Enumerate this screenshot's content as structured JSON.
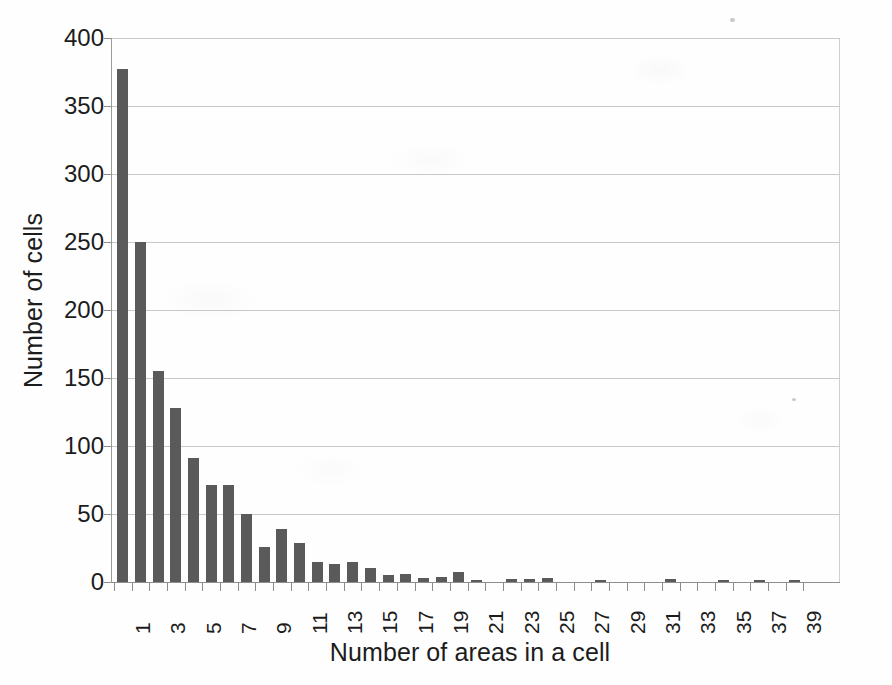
{
  "chart_data": {
    "type": "bar",
    "title": "",
    "subtitle": "",
    "xlabel": "Number of areas in a cell",
    "ylabel": "Number of cells",
    "xlim": [
      0,
      41
    ],
    "ylim": [
      0,
      400
    ],
    "ytick_values": [
      0,
      50,
      100,
      150,
      200,
      250,
      300,
      350,
      400
    ],
    "ytick_labels": [
      "0",
      "50",
      "100",
      "150",
      "200",
      "250",
      "300",
      "350",
      "400"
    ],
    "xtick_values": [
      1,
      3,
      5,
      7,
      9,
      11,
      13,
      15,
      17,
      19,
      21,
      23,
      25,
      27,
      29,
      31,
      33,
      35,
      37,
      39
    ],
    "xtick_labels": [
      "1",
      "3",
      "5",
      "7",
      "9",
      "11",
      "13",
      "15",
      "17",
      "19",
      "21",
      "23",
      "25",
      "27",
      "29",
      "31",
      "33",
      "35",
      "37",
      "39"
    ],
    "xtick_rotation": -90,
    "grid": "horizontal",
    "legend": "none",
    "bar_color": "#5a5a5a",
    "grid_color": "#c9c9c9",
    "background_color": "#ffffff",
    "categories": [
      1,
      2,
      3,
      4,
      5,
      6,
      7,
      8,
      9,
      10,
      11,
      12,
      13,
      14,
      15,
      16,
      17,
      18,
      19,
      20,
      21,
      22,
      23,
      24,
      25,
      26,
      27,
      28,
      29,
      30,
      31,
      32,
      33,
      34,
      35,
      36,
      37,
      38,
      39,
      40
    ],
    "values": [
      377,
      250,
      155,
      128,
      91,
      71,
      71,
      50,
      26,
      39,
      29,
      15,
      13,
      15,
      10,
      5,
      6,
      3,
      4,
      7,
      1,
      0,
      2,
      2,
      3,
      0,
      0,
      1,
      0,
      0,
      0,
      2,
      0,
      0,
      1,
      0,
      1,
      0,
      1,
      0
    ],
    "series": [
      {
        "name": "Number of cells",
        "values": [
          377,
          250,
          155,
          128,
          91,
          71,
          71,
          50,
          26,
          39,
          29,
          15,
          13,
          15,
          10,
          5,
          6,
          3,
          4,
          7,
          1,
          0,
          2,
          2,
          3,
          0,
          0,
          1,
          0,
          0,
          0,
          2,
          0,
          0,
          1,
          0,
          1,
          0,
          1,
          0
        ]
      }
    ]
  }
}
